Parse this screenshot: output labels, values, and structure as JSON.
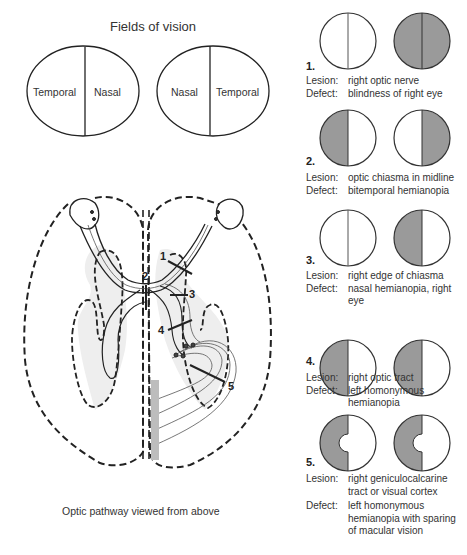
{
  "fields_of_vision": {
    "title": "Fields of vision",
    "left_eye": {
      "left_label": "Temporal",
      "right_label": "Nasal"
    },
    "right_eye": {
      "left_label": "Nasal",
      "right_label": "Temporal"
    }
  },
  "optic_pathway": {
    "caption": "Optic pathway viewed from above",
    "lesion_markers": [
      "1",
      "2",
      "3",
      "4",
      "5"
    ]
  },
  "colors": {
    "defect_fill": "#9a9a9a",
    "outline": "#222222",
    "shading": "#ececec"
  },
  "cases": [
    {
      "number": "1.",
      "lesion_key": "Lesion:",
      "lesion": "right optic nerve",
      "defect_key": "Defect:",
      "defect": "blindness of right eye",
      "left_field": "normal",
      "right_field": "total"
    },
    {
      "number": "2.",
      "lesion_key": "Lesion:",
      "lesion": "optic chiasma in midline",
      "defect_key": "Defect:",
      "defect": "bitemporal hemianopia",
      "left_field": "left-half",
      "right_field": "right-half"
    },
    {
      "number": "3.",
      "lesion_key": "Lesion:",
      "lesion": "right edge of chiasma",
      "defect_key": "Defect:",
      "defect": "nasal hemianopia, right eye",
      "left_field": "normal",
      "right_field": "left-half"
    },
    {
      "number": "4.",
      "lesion_key": "Lesion:",
      "lesion": "right optic tract",
      "defect_key": "Defect:",
      "defect": "left homonymous hemianopia",
      "left_field": "left-half",
      "right_field": "left-half"
    },
    {
      "number": "5.",
      "lesion_key": "Lesion:",
      "lesion": "right geniculocalcarine tract or visual cortex",
      "defect_key": "Defect:",
      "defect": "left homonymous hemianopia with sparing of macular vision",
      "left_field": "left-half-macular-sparing",
      "right_field": "left-half-macular-sparing"
    }
  ]
}
